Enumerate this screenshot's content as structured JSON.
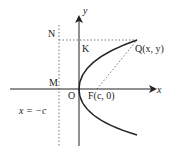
{
  "diagram": {
    "title": "",
    "axes": {
      "x_label": "x",
      "y_label": "y",
      "origin_label": "O"
    },
    "points": {
      "N": "N",
      "K": "K",
      "M": "M",
      "focus": "F(c, 0)",
      "Q": "Q(x, y)"
    },
    "directrix_label": "x = −c",
    "curve": "parabola opening right, vertex at origin",
    "colors": {
      "stroke": "#222222",
      "dotted": "#777777",
      "background": "#ffffff"
    }
  }
}
